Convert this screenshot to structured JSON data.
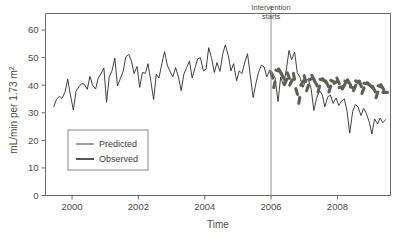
{
  "chart_data": {
    "type": "line",
    "title": "",
    "xlabel": "Time",
    "ylabel": "mL/min per 1.73 m²",
    "xlim": [
      1999.2,
      2009.6
    ],
    "ylim": [
      0,
      66
    ],
    "xticks": [
      2000,
      2002,
      2004,
      2006,
      2008
    ],
    "xticklabels": [
      "2000",
      "2002",
      "2004",
      "2006",
      "2008"
    ],
    "yticks": [
      0,
      10,
      20,
      30,
      40,
      50,
      60
    ],
    "yticklabels": [
      "0",
      "10",
      "20",
      "30",
      "40",
      "50",
      "60"
    ],
    "grid": false,
    "legend_position": "lower-left-inside",
    "annotations": [
      {
        "name": "intervention-marker",
        "text_line1": "Intervention",
        "text_line2": "starts",
        "x": 2006,
        "type": "vertical-line"
      }
    ],
    "series": [
      {
        "name": "Predicted",
        "color": "#5f5f5a",
        "style": "thick-dotted",
        "x": [
          2006.02,
          2006.1,
          2006.19,
          2006.27,
          2006.35,
          2006.44,
          2006.52,
          2006.6,
          2006.69,
          2006.77,
          2006.85,
          2006.94,
          2007.02,
          2007.1,
          2007.19,
          2007.27,
          2007.35,
          2007.44,
          2007.52,
          2007.6,
          2007.69,
          2007.77,
          2007.85,
          2007.94,
          2008.02,
          2008.1,
          2008.19,
          2008.27,
          2008.35,
          2008.44,
          2008.52,
          2008.6,
          2008.69,
          2008.77,
          2008.85,
          2008.94,
          2009.02,
          2009.1,
          2009.19,
          2009.27,
          2009.35,
          2009.44
        ],
        "y": [
          43.6,
          40.2,
          45.3,
          45.0,
          43.3,
          41.2,
          43.5,
          41.0,
          43.2,
          37.7,
          34.5,
          40.8,
          42.4,
          39.0,
          42.2,
          42.6,
          40.7,
          38.6,
          42.0,
          41.7,
          40.5,
          38.6,
          41.5,
          41.0,
          41.6,
          39.3,
          39.6,
          41.3,
          41.0,
          39.2,
          39.0,
          41.2,
          40.5,
          38.0,
          40.6,
          40.4,
          39.5,
          38.6,
          36.5,
          39.6,
          39.3,
          37.4
        ]
      },
      {
        "name": "Observed",
        "color": "#2b2b28",
        "style": "thin-solid",
        "x": [
          1999.45,
          1999.53,
          1999.62,
          1999.7,
          1999.79,
          1999.87,
          1999.95,
          2000.04,
          2000.12,
          2000.21,
          2000.29,
          2000.37,
          2000.46,
          2000.54,
          2000.62,
          2000.71,
          2000.79,
          2000.87,
          2000.96,
          2001.04,
          2001.12,
          2001.21,
          2001.29,
          2001.37,
          2001.46,
          2001.54,
          2001.62,
          2001.71,
          2001.79,
          2001.87,
          2001.96,
          2002.04,
          2002.12,
          2002.21,
          2002.29,
          2002.37,
          2002.46,
          2002.54,
          2002.62,
          2002.71,
          2002.79,
          2002.87,
          2002.96,
          2003.04,
          2003.12,
          2003.21,
          2003.29,
          2003.37,
          2003.46,
          2003.54,
          2003.62,
          2003.71,
          2003.79,
          2003.87,
          2003.96,
          2004.04,
          2004.12,
          2004.21,
          2004.29,
          2004.37,
          2004.46,
          2004.54,
          2004.62,
          2004.71,
          2004.79,
          2004.87,
          2004.96,
          2005.04,
          2005.12,
          2005.21,
          2005.29,
          2005.37,
          2005.46,
          2005.54,
          2005.62,
          2005.71,
          2005.79,
          2005.87,
          2005.96,
          2006.04,
          2006.12,
          2006.21,
          2006.29,
          2006.37,
          2006.46,
          2006.54,
          2006.62,
          2006.71,
          2006.79,
          2006.87,
          2006.96,
          2007.04,
          2007.12,
          2007.21,
          2007.29,
          2007.37,
          2007.46,
          2007.54,
          2007.62,
          2007.71,
          2007.79,
          2007.87,
          2007.96,
          2008.04,
          2008.12,
          2008.21,
          2008.29,
          2008.37,
          2008.46,
          2008.54,
          2008.62,
          2008.71,
          2008.79,
          2008.87,
          2008.96,
          2009.04,
          2009.12,
          2009.21,
          2009.29,
          2009.37,
          2009.45
        ],
        "y": [
          32.2,
          34.8,
          36.0,
          35.2,
          37.5,
          42.2,
          36.5,
          31.0,
          37.8,
          39.5,
          40.6,
          40.3,
          38.5,
          43.2,
          40.0,
          38.6,
          42.6,
          44.1,
          46.2,
          33.8,
          43.0,
          45.4,
          49.8,
          39.7,
          42.5,
          45.0,
          50.2,
          51.2,
          48.8,
          44.2,
          46.8,
          39.2,
          44.6,
          44.3,
          47.8,
          41.8,
          34.8,
          44.0,
          42.6,
          48.0,
          52.2,
          47.3,
          44.8,
          43.0,
          46.4,
          42.9,
          38.0,
          44.0,
          46.5,
          48.8,
          42.6,
          46.4,
          49.6,
          50.0,
          45.2,
          45.8,
          53.6,
          49.6,
          44.6,
          48.2,
          45.0,
          51.2,
          54.6,
          50.8,
          45.2,
          47.8,
          41.6,
          45.2,
          44.2,
          48.4,
          51.4,
          43.8,
          35.5,
          40.5,
          44.6,
          47.3,
          46.6,
          43.0,
          45.5,
          44.5,
          42.6,
          34.1,
          43.0,
          40.0,
          45.6,
          52.6,
          49.2,
          52.0,
          44.6,
          42.9,
          39.2,
          41.6,
          42.2,
          38.5,
          30.8,
          35.2,
          38.0,
          36.7,
          32.2,
          35.8,
          36.4,
          33.4,
          35.4,
          32.6,
          34.2,
          35.0,
          30.6,
          22.6,
          30.5,
          33.0,
          32.1,
          29.0,
          31.6,
          29.8,
          26.6,
          22.3,
          27.8,
          26.0,
          28.1,
          26.4,
          27.5
        ]
      }
    ]
  },
  "legend": {
    "items": [
      {
        "label": "Predicted",
        "color": "#8c8c86"
      },
      {
        "label": "Observed",
        "color": "#2b2b28"
      }
    ]
  },
  "axes": {
    "x_title": "Time",
    "y_title": "mL/min per 1.73 m"
  }
}
